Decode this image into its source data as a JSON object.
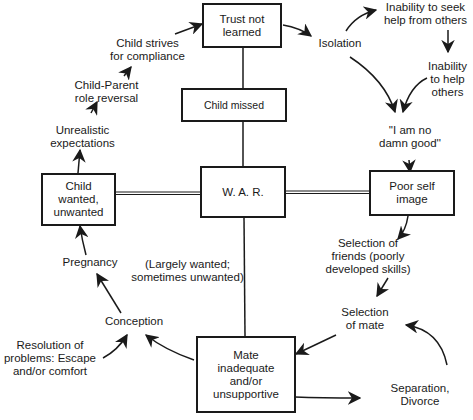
{
  "diagram": {
    "boxes": {
      "trust": "Trust not\nlearned",
      "child_missed": "Child missed",
      "war": "W. A. R.",
      "child_wanted": "Child\nwanted,\nunwanted",
      "poor_self": "Poor self\nimage",
      "mate": "Mate\ninadequate\nand/or\nunsupportive"
    },
    "labels": {
      "isolation": "Isolation",
      "inability_seek": "Inability to seek\nhelp from others",
      "inability_help": "Inability\nto help\nothers",
      "no_good": "''I am no\ndamn good''",
      "selection_friends": "Selection of\nfriends (poorly\ndeveloped skills)",
      "selection_mate": "Selection\nof mate",
      "separation": "Separation,\nDivorce",
      "conception": "Conception",
      "resolution": "Resolution of\nproblems: Escape\nand/or comfort",
      "largely_wanted": "(Largely wanted;\nsometimes unwanted)",
      "pregnancy": "Pregnancy",
      "unrealistic": "Unrealistic\nexpectations",
      "role_reversal": "Child-Parent\nrole reversal",
      "strives": "Child strives\nfor compliance"
    },
    "colors": {
      "ink": "#1a1a1a",
      "background": "#ffffff"
    }
  }
}
